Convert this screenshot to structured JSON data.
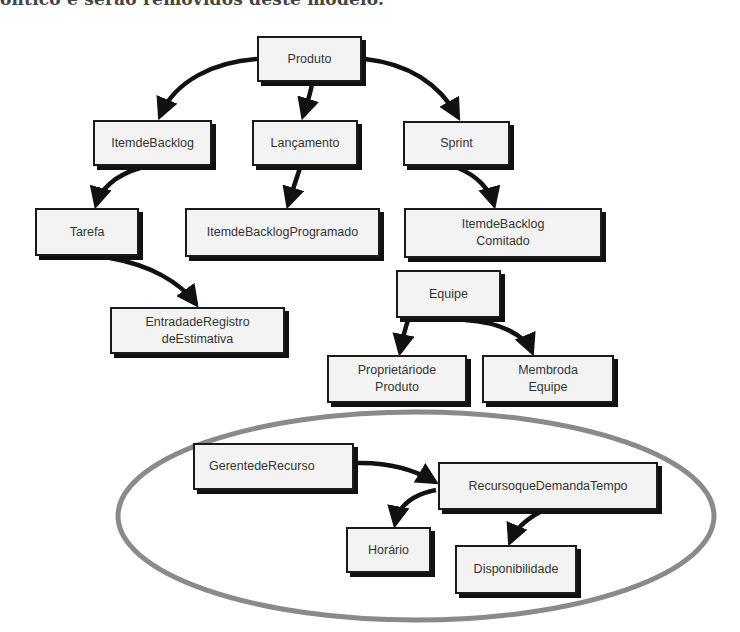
{
  "header": {
    "clipped_text": "ôntico e serão removidos deste modelo."
  },
  "diagram": {
    "nodes": {
      "produto": "Produto",
      "item_backlog": "ItemdeBacklog",
      "lancamento": "Lançamento",
      "sprint": "Sprint",
      "tarefa": "Tarefa",
      "item_backlog_programado": "ItemdeBacklogProgramado",
      "item_backlog_comitado": "ItemdeBacklog\nComitado",
      "entrada_registro": "EntradadeRegistro\ndeEstimativa",
      "equipe": "Equipe",
      "proprietario_produto": "Proprietáriode\nProduto",
      "membro_equipe": "Membroda\nEquipe",
      "gerente_recurso": "GerentedeRecurso",
      "recurso_demanda_tempo": "RecursoqueDemandaTempo",
      "horario": "Horário",
      "disponibilidade": "Disponibilidade"
    },
    "edges": [
      [
        "Produto",
        "ItemdeBacklog"
      ],
      [
        "Produto",
        "Lançamento"
      ],
      [
        "Produto",
        "Sprint"
      ],
      [
        "ItemdeBacklog",
        "Tarefa"
      ],
      [
        "Lançamento",
        "ItemdeBacklogProgramado"
      ],
      [
        "Sprint",
        "ItemdeBacklog Comitado"
      ],
      [
        "Tarefa",
        "EntradadeRegistro deEstimativa"
      ],
      [
        "Equipe",
        "Proprietáriode Produto"
      ],
      [
        "Equipe",
        "Membroda Equipe"
      ],
      [
        "GerentedeRecurso",
        "RecursoqueDemandaTempo"
      ],
      [
        "RecursoqueDemandaTempo",
        "Horário"
      ],
      [
        "RecursoqueDemandaTempo",
        "Disponibilidade"
      ]
    ],
    "highlight": {
      "shape": "ellipse",
      "color": "#8a8a8a",
      "encloses": [
        "GerentedeRecurso",
        "RecursoqueDemandaTempo",
        "Horário",
        "Disponibilidade"
      ]
    }
  }
}
